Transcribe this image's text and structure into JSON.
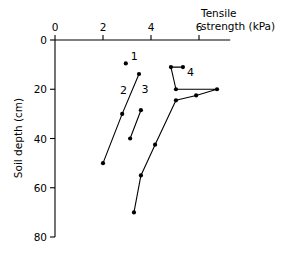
{
  "chart_data": {
    "type": "line",
    "title": "",
    "xlabel": "Tensile strength (kPa)",
    "ylabel": "Soil depth (cm)",
    "xlabel_line1": "Tensile",
    "xlabel_line2": "strength (kPa)",
    "xlim": [
      0,
      7.3
    ],
    "ylim": [
      0,
      80
    ],
    "y_inverted": true,
    "x_axis_position": "top",
    "grid": false,
    "legend": "inline-annotations",
    "xticks": [
      0,
      2,
      4,
      6
    ],
    "xticklabels": [
      "0",
      "2",
      "4",
      "6"
    ],
    "yticks": [
      0,
      20,
      40,
      60,
      80
    ],
    "yticklabels": [
      "0",
      "20",
      "40",
      "60",
      "80"
    ],
    "series": [
      {
        "name": "1",
        "label": "1",
        "label_x": 3.3,
        "label_y": 8.0,
        "marker": "dot",
        "line": false,
        "points": [
          {
            "x": 2.95,
            "y": 9.5
          }
        ]
      },
      {
        "name": "2",
        "label": "2",
        "label_x": 2.85,
        "label_y": 22.0,
        "marker": "dot",
        "line": true,
        "points": [
          {
            "x": 3.5,
            "y": 13.8
          },
          {
            "x": 2.8,
            "y": 30.0
          },
          {
            "x": 2.0,
            "y": 50.0
          }
        ]
      },
      {
        "name": "3",
        "label": "3",
        "label_x": 3.75,
        "label_y": 21.5,
        "marker": "dot",
        "line": true,
        "points": [
          {
            "x": 3.58,
            "y": 28.5
          },
          {
            "x": 3.13,
            "y": 40.0
          }
        ]
      },
      {
        "name": "4",
        "label": "4",
        "label_x": 5.65,
        "label_y": 14.5,
        "marker": "dot",
        "line": true,
        "points": [
          {
            "x": 5.33,
            "y": 11.0
          },
          {
            "x": 4.83,
            "y": 11.0
          },
          {
            "x": 5.04,
            "y": 20.0
          },
          {
            "x": 6.75,
            "y": 20.0
          },
          {
            "x": 5.88,
            "y": 22.5
          },
          {
            "x": 5.04,
            "y": 24.5
          },
          {
            "x": 4.17,
            "y": 42.5
          },
          {
            "x": 3.58,
            "y": 55.0
          },
          {
            "x": 3.29,
            "y": 70.0
          }
        ]
      }
    ]
  }
}
